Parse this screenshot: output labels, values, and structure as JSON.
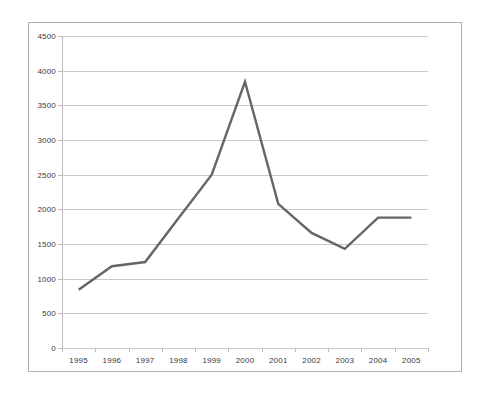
{
  "chart_data": {
    "type": "line",
    "title": "",
    "subtitle": "",
    "xlabel": "",
    "ylabel": "",
    "categories": [
      "1995",
      "1996",
      "1997",
      "1998",
      "1999",
      "2000",
      "2001",
      "2002",
      "2003",
      "2004",
      "2005"
    ],
    "series": [
      {
        "name": "",
        "values": [
          840,
          1180,
          1240,
          1870,
          2500,
          3840,
          2080,
          1660,
          1430,
          1880,
          1880
        ],
        "color": "#666666",
        "line_width": 2.4
      }
    ],
    "ylim": [
      0,
      4500
    ],
    "y_ticks": [
      0,
      500,
      1000,
      1500,
      2000,
      2500,
      3000,
      3500,
      4000,
      4500
    ],
    "y_tick_labels": [
      "0",
      "500",
      "1000",
      "1500",
      "2000",
      "2500",
      "3000",
      "3500",
      "4000",
      "4500"
    ],
    "x_tick_labels": [
      "1995",
      "1996",
      "1997",
      "1998",
      "1999",
      "2000",
      "2001",
      "2002",
      "2003",
      "2004",
      "2005"
    ],
    "grid": true,
    "grid_axis": "y",
    "legend": false,
    "legend_position": "none",
    "markers": false,
    "colors": {
      "series_line": "#666666",
      "gridline": "#c8c8c8",
      "axis": "#bdbdbd",
      "tick_text": "#3a3a3a",
      "figure_border": "#b0b0b0",
      "background": "#ffffff"
    }
  }
}
